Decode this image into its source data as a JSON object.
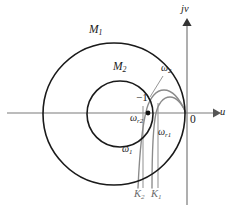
{
  "figure": {
    "kind": "nyquist-plot-with-m-circles",
    "background": "#ffffff",
    "curve_color": "#8a8a8a",
    "circle_color": "#1a1a1a",
    "axis_color": "#7a7a7a",
    "label_color": "#1a1a1a",
    "gridline_color": "#9a9a9a"
  },
  "axes": {
    "horizontal": {
      "name": "real-axis",
      "label": "u",
      "y": 113,
      "x_start": 7,
      "x_end": 215,
      "arrow": "right"
    },
    "vertical": {
      "name": "imaginary-axis",
      "label": "jv",
      "x": 187,
      "y_top": 20,
      "y_bottom": 205,
      "arrow": "up"
    },
    "origin_label": "0"
  },
  "circles": [
    {
      "label": "M",
      "subscript": "1",
      "cx": 114,
      "cy": 114,
      "r": 71,
      "label_x": 93,
      "label_y": 31
    },
    {
      "label": "M",
      "subscript": "2",
      "cx": 120,
      "cy": 114,
      "r": 33,
      "label_x": 117,
      "label_y": 68
    }
  ],
  "critical_point": {
    "label": "−1",
    "x": 148,
    "y": 113,
    "label_x": 138,
    "label_y": 98
  },
  "curves": [
    {
      "name": "nyquist-curve-k1",
      "frequency_markers": [
        "omega_1",
        "omega_r1"
      ]
    },
    {
      "name": "nyquist-curve-k2",
      "frequency_markers": [
        "omega_2",
        "omega_r2"
      ]
    }
  ],
  "gain_lines": [
    {
      "label": "K",
      "subscript": "2",
      "x": 143,
      "y_top": 106,
      "y_bottom": 188,
      "label_x": 137,
      "label_y": 192
    },
    {
      "label": "K",
      "subscript": "1",
      "x": 158,
      "y_top": 104,
      "y_bottom": 188,
      "label_x": 153,
      "label_y": 192
    }
  ],
  "annotations": [
    {
      "name": "omega-2-label",
      "base": "ω",
      "sub": "2",
      "x": 164,
      "y": 68,
      "leader": true
    },
    {
      "name": "omega-r2-label",
      "base": "ω",
      "sub": "r2",
      "x": 133,
      "y": 117,
      "leader": false
    },
    {
      "name": "omega-r1-label",
      "base": "ω",
      "sub": "r1",
      "x": 160,
      "y": 131,
      "leader": false
    },
    {
      "name": "omega-1-label",
      "base": "ω",
      "sub": "1",
      "x": 125,
      "y": 148,
      "leader": false
    }
  ]
}
